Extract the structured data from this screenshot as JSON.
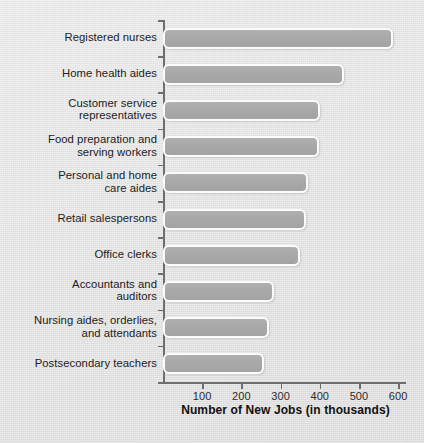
{
  "chart_data": {
    "type": "bar",
    "orientation": "horizontal",
    "title": "",
    "xlabel": "Number of New Jobs (in thousands)",
    "ylabel": "",
    "xlim": [
      0,
      620
    ],
    "xticks": [
      100,
      200,
      300,
      400,
      500,
      600
    ],
    "xticklabels": [
      "100",
      "200",
      "300",
      "400",
      "500",
      "600"
    ],
    "grid": false,
    "legend": null,
    "categories": [
      "Registered nurses",
      "Customer service representatives",
      "Home health aides",
      "Food preparation and serving workers",
      "Personal and home care aides",
      "Retail salespersons",
      "Office clerks",
      "Accountants and auditors",
      "Nursing aides, orderlies, and attendants",
      "Postsecondary teachers"
    ],
    "bars": [
      {
        "label_line1": "Registered nurses",
        "label_line2": "",
        "value": 587
      },
      {
        "label_line1": "Home health aides",
        "label_line2": "",
        "value": 463
      },
      {
        "label_line1": "Customer service",
        "label_line2": "representatives",
        "value": 400
      },
      {
        "label_line1": "Food preparation and",
        "label_line2": "serving workers",
        "value": 398
      },
      {
        "label_line1": "Personal and home",
        "label_line2": "care aides",
        "value": 370
      },
      {
        "label_line1": "Retail salespersons",
        "label_line2": "",
        "value": 364
      },
      {
        "label_line1": "Office clerks",
        "label_line2": "",
        "value": 350
      },
      {
        "label_line1": "Accountants and",
        "label_line2": "auditors",
        "value": 282
      },
      {
        "label_line1": "Nursing aides, orderlies,",
        "label_line2": "and attendants",
        "value": 270
      },
      {
        "label_line1": "Postsecondary teachers",
        "label_line2": "",
        "value": 257
      }
    ],
    "values": [
      587,
      463,
      400,
      398,
      370,
      364,
      350,
      282,
      270,
      257
    ],
    "colors": {
      "background": "#e4e4e4",
      "bar_fill": "#a9a9a9",
      "bar_edge": "#fbfbfb",
      "axis": "#6e6e6e",
      "text": "#1c1c1c"
    }
  }
}
